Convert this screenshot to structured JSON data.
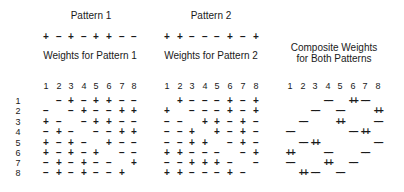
{
  "titles": {
    "pattern1": "Pattern 1",
    "pattern2": "Pattern 2",
    "weights1": "Weights for Pattern 1",
    "weights2": "Weights for Pattern 2",
    "composite_line1": "Composite Weights",
    "composite_line2": "for Both Patterns"
  },
  "patterns": {
    "pattern1": [
      "+",
      "−",
      "+",
      "−",
      "+",
      "+",
      "−",
      "−"
    ],
    "pattern2": [
      "+",
      "+",
      "−",
      "−",
      "−",
      "+",
      "−",
      "+"
    ]
  },
  "column_labels": [
    "1",
    "2",
    "3",
    "4",
    "5",
    "6",
    "7",
    "8"
  ],
  "row_labels": [
    "1",
    "2",
    "3",
    "4",
    "5",
    "6",
    "7",
    "8"
  ],
  "weights1": [
    [
      "",
      "−",
      "+",
      "−",
      "+",
      "+",
      "−",
      "−"
    ],
    [
      "−",
      "",
      "−",
      "+",
      "−",
      "−",
      "+",
      "+"
    ],
    [
      "+",
      "−",
      "",
      "−",
      "+",
      "+",
      "−",
      "−"
    ],
    [
      "−",
      "+",
      "−",
      "",
      "−",
      "−",
      "+",
      "+"
    ],
    [
      "+",
      "−",
      "+",
      "−",
      "",
      "+",
      "−",
      "−"
    ],
    [
      "+",
      "−",
      "+",
      "−",
      "+",
      "",
      "−",
      "−"
    ],
    [
      "−",
      "+",
      "−",
      "+",
      "−",
      "−",
      "",
      "+"
    ],
    [
      "−",
      "+",
      "−",
      "+",
      "−",
      "−",
      "+",
      ""
    ]
  ],
  "weights2": [
    [
      "",
      "+",
      "−",
      "−",
      "−",
      "+",
      "−",
      "+"
    ],
    [
      "+",
      "",
      "−",
      "−",
      "−",
      "+",
      "−",
      "+"
    ],
    [
      "−",
      "−",
      "",
      "+",
      "+",
      "−",
      "+",
      "−"
    ],
    [
      "−",
      "−",
      "+",
      "",
      "+",
      "−",
      "+",
      "−"
    ],
    [
      "−",
      "−",
      "+",
      "+",
      "",
      "−",
      "+",
      "−"
    ],
    [
      "+",
      "+",
      "−",
      "−",
      "−",
      "",
      "−",
      "+"
    ],
    [
      "−",
      "−",
      "+",
      "+",
      "+",
      "−",
      "",
      "−"
    ],
    [
      "+",
      "+",
      "−",
      "−",
      "−",
      "+",
      "−",
      ""
    ]
  ],
  "composite": [
    [
      "",
      "",
      "",
      "−−",
      "",
      "++",
      "−−",
      ""
    ],
    [
      "",
      "",
      "−−",
      "",
      "−−",
      "",
      "",
      "++"
    ],
    [
      "",
      "−−",
      "",
      "",
      "++",
      "",
      "",
      "−−"
    ],
    [
      "−−",
      "",
      "",
      "",
      "",
      "−−",
      "++",
      ""
    ],
    [
      "",
      "−−",
      "++",
      "",
      "",
      "",
      "",
      "−−"
    ],
    [
      "++",
      "",
      "",
      "−−",
      "",
      "",
      "−−",
      ""
    ],
    [
      "−−",
      "",
      "",
      "++",
      "",
      "−−",
      "",
      ""
    ],
    [
      "",
      "++",
      "−−",
      "",
      "−−",
      "",
      "",
      ""
    ]
  ]
}
